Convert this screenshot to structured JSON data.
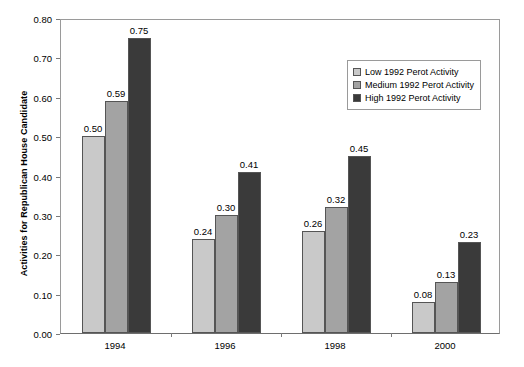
{
  "chart_data": {
    "type": "bar",
    "title": "",
    "xlabel": "",
    "ylabel": "Activities for Republican House Candidate",
    "categories": [
      "1994",
      "1996",
      "1998",
      "2000"
    ],
    "ylim": [
      0.0,
      0.8
    ],
    "ytick_labels": [
      "0.00",
      "0.10",
      "0.20",
      "0.30",
      "0.40",
      "0.50",
      "0.60",
      "0.70",
      "0.80"
    ],
    "ytick_values": [
      0.0,
      0.1,
      0.2,
      0.3,
      0.4,
      0.5,
      0.6,
      0.7,
      0.8
    ],
    "grid": false,
    "legend_position": "upper right",
    "series": [
      {
        "name": "Low 1992 Perot Activity",
        "color": "#c9c9c9",
        "values": [
          0.5,
          0.24,
          0.26,
          0.08
        ],
        "labels": [
          "0.50",
          "0.24",
          "0.26",
          "0.08"
        ]
      },
      {
        "name": "Medium 1992 Perot Activity",
        "color": "#a3a3a3",
        "values": [
          0.59,
          0.3,
          0.32,
          0.13
        ],
        "labels": [
          "0.59",
          "0.30",
          "0.32",
          "0.13"
        ]
      },
      {
        "name": "High 1992 Perot Activity",
        "color": "#3a3a3a",
        "values": [
          0.75,
          0.41,
          0.45,
          0.23
        ],
        "labels": [
          "0.75",
          "0.41",
          "0.45",
          "0.23"
        ]
      }
    ]
  },
  "legend": {
    "items": [
      {
        "label": "Low 1992 Perot Activity",
        "color": "#c9c9c9"
      },
      {
        "label": "Medium 1992 Perot Activity",
        "color": "#a3a3a3"
      },
      {
        "label": "High 1992 Perot Activity",
        "color": "#3a3a3a"
      }
    ]
  },
  "axes": {
    "y_title": "Activities for Republican House Candidate"
  }
}
